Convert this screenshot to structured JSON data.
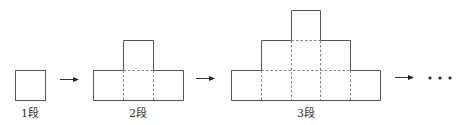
{
  "diagram": {
    "stages": [
      {
        "label": "1段",
        "rows": [
          1
        ]
      },
      {
        "label": "2段",
        "rows": [
          1,
          3
        ]
      },
      {
        "label": "3段",
        "rows": [
          1,
          3,
          5
        ]
      }
    ],
    "continuation": "…",
    "connector_icon": "right-arrow-icon"
  }
}
